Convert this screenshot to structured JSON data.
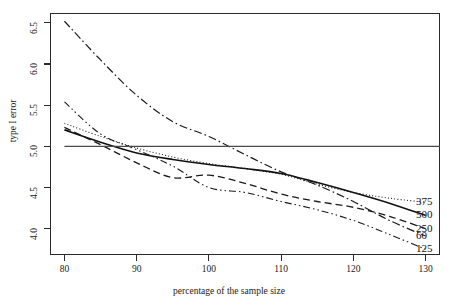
{
  "chart_data": {
    "type": "line",
    "title": "",
    "subtitle": "",
    "xlabel": "percentage of the sample size",
    "ylabel": "type I error",
    "xlim": [
      78,
      132
    ],
    "ylim": [
      3.68,
      6.62
    ],
    "xticks": [
      80,
      90,
      100,
      110,
      120,
      130
    ],
    "xtick_labels": [
      "80",
      "90",
      "100",
      "110",
      "120",
      "130"
    ],
    "yticks": [
      4.0,
      4.5,
      5.0,
      5.5,
      6.0,
      6.5
    ],
    "ytick_labels": [
      "4.0",
      "4.5",
      "5.0",
      "5.5",
      "6.0",
      "6.5"
    ],
    "grid": false,
    "legend_position": "right-inside",
    "x": [
      80,
      85,
      90,
      95,
      100,
      105,
      110,
      115,
      120,
      125,
      130
    ],
    "series": [
      {
        "name": "375",
        "label": "375",
        "dash": "dotted",
        "color": "#1a1a1a",
        "width": 1.1,
        "values": [
          5.28,
          5.12,
          4.98,
          4.87,
          4.79,
          4.73,
          4.66,
          4.54,
          4.44,
          4.37,
          4.32
        ]
      },
      {
        "name": "500",
        "label": "500",
        "dash": "solid",
        "color": "#111111",
        "width": 1.6,
        "values": [
          5.2,
          5.05,
          4.92,
          4.84,
          4.78,
          4.73,
          4.67,
          4.56,
          4.44,
          4.31,
          4.16
        ]
      },
      {
        "name": "250",
        "label": "250",
        "dash": "dashed",
        "color": "#1a1a1a",
        "width": 1.3,
        "values": [
          5.23,
          5.02,
          4.8,
          4.62,
          4.65,
          4.55,
          4.42,
          4.33,
          4.26,
          4.15,
          4.0
        ]
      },
      {
        "name": "60",
        "label": "60",
        "dash": "dashdot",
        "color": "#1a1a1a",
        "width": 1.2,
        "values": [
          6.52,
          6.05,
          5.62,
          5.3,
          5.12,
          4.9,
          4.69,
          4.53,
          4.33,
          4.1,
          3.91
        ]
      },
      {
        "name": "125",
        "label": "125",
        "dash": "dashdotdot",
        "color": "#1a1a1a",
        "width": 1.1,
        "values": [
          5.54,
          5.15,
          4.96,
          4.76,
          4.5,
          4.44,
          4.33,
          4.23,
          4.1,
          3.93,
          3.75
        ]
      }
    ],
    "reference_line": {
      "name": "nominal-level",
      "y": 5.0,
      "style": "solid",
      "color": "#4a4a4a",
      "width": 1.4,
      "x_start": 80,
      "x_end": 132
    },
    "annotations": []
  },
  "legend": {
    "items": [
      {
        "label": "375"
      },
      {
        "label": "500"
      },
      {
        "label": "250"
      },
      {
        "label": "60"
      },
      {
        "label": "125"
      }
    ]
  }
}
